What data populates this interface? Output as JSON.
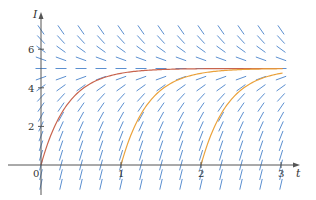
{
  "chart_data": {
    "type": "line",
    "title": "",
    "subtitle": "",
    "xlabel": "t",
    "ylabel": "I",
    "xlim": [
      0,
      3.2
    ],
    "ylim": [
      -1.2,
      7.8
    ],
    "x_ticks": [
      {
        "value": 0,
        "label": "0"
      },
      {
        "value": 1,
        "label": "1"
      },
      {
        "value": 2,
        "label": "2"
      },
      {
        "value": 3,
        "label": "3"
      }
    ],
    "y_ticks": [
      {
        "value": 2,
        "label": "2"
      },
      {
        "value": 4,
        "label": "4"
      },
      {
        "value": 6,
        "label": "6"
      }
    ],
    "grid": false,
    "legend": null,
    "direction_field": {
      "equation": "dI/dt = 15 - 3I",
      "t_values": [
        0,
        0.25,
        0.5,
        0.75,
        1,
        1.25,
        1.5,
        1.75,
        2,
        2.25,
        2.5,
        2.75,
        3
      ],
      "I_values": [
        -1,
        -0.5,
        0,
        0.5,
        1,
        1.5,
        2,
        2.5,
        3,
        3.5,
        4,
        4.5,
        5,
        5.5,
        6,
        6.5,
        7
      ],
      "equilibrium": 5,
      "color": "#5b8fd0"
    },
    "series": [
      {
        "name": "solution t0=0",
        "t0": 0,
        "formula": "I = 5(1 - e^(-3t))",
        "color": "#c8644e",
        "x": [
          0,
          0.25,
          0.5,
          0.75,
          1,
          1.5,
          2,
          2.5,
          3
        ],
        "values": [
          0,
          2.64,
          3.88,
          4.47,
          4.75,
          4.94,
          4.99,
          5.0,
          5.0
        ]
      },
      {
        "name": "solution t0=1",
        "t0": 1,
        "formula": "I = 5(1 - e^(-3(t-1)))",
        "color": "#eaa23c",
        "x": [
          1,
          1.25,
          1.5,
          1.75,
          2,
          2.5,
          3
        ],
        "values": [
          0,
          2.64,
          3.88,
          4.47,
          4.75,
          4.94,
          4.99
        ]
      },
      {
        "name": "solution t0=2",
        "t0": 2,
        "formula": "I = 5(1 - e^(-3(t-2)))",
        "color": "#eaa23c",
        "x": [
          2,
          2.25,
          2.5,
          2.75,
          3
        ],
        "values": [
          0,
          2.64,
          3.88,
          4.47,
          4.75
        ]
      }
    ],
    "layout": {
      "origin_px": [
        41,
        165
      ],
      "px_per_t": 80,
      "px_per_I": 19.3,
      "x_axis_end_px": 300,
      "y_axis_top_px": 12,
      "y_axis_bottom_px": 195,
      "axis_color": "#555555",
      "segment_half_len_px": 5.5
    }
  }
}
